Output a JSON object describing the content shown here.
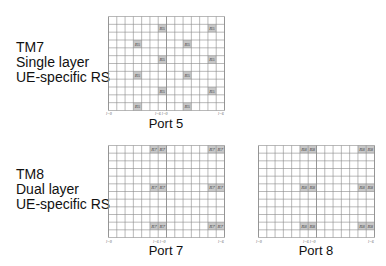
{
  "tm7": {
    "lines": [
      "TM7",
      "Single layer",
      "UE-specific RS"
    ],
    "port_label": "Port 5",
    "rs_label": "R5",
    "columns": 14,
    "rows": 12,
    "rs_cells": [
      [
        6,
        1
      ],
      [
        12,
        1
      ],
      [
        3,
        3
      ],
      [
        9,
        3
      ],
      [
        6,
        5
      ],
      [
        12,
        5
      ],
      [
        3,
        7
      ],
      [
        9,
        7
      ],
      [
        6,
        9
      ],
      [
        12,
        9
      ],
      [
        3,
        11
      ],
      [
        9,
        11
      ]
    ],
    "axis_labels": [
      "l=0",
      "l=6 l=0",
      "l=6"
    ]
  },
  "tm8": {
    "lines": [
      "TM8",
      "Dual layer",
      "UE-specific RS"
    ],
    "ports": [
      {
        "port_label": "Port 7",
        "rs_label": "R7",
        "columns": 14,
        "rows": 12,
        "rs_cells": [
          [
            5,
            0
          ],
          [
            6,
            0
          ],
          [
            12,
            0
          ],
          [
            13,
            0
          ],
          [
            5,
            5
          ],
          [
            6,
            5
          ],
          [
            12,
            5
          ],
          [
            13,
            5
          ],
          [
            5,
            10
          ],
          [
            6,
            10
          ],
          [
            12,
            10
          ],
          [
            13,
            10
          ]
        ],
        "axis_labels": [
          "l=0",
          "l=6 l=0",
          "l=6"
        ]
      },
      {
        "port_label": "Port 8",
        "rs_label": "R8",
        "columns": 14,
        "rows": 12,
        "rs_cells": [
          [
            5,
            0
          ],
          [
            6,
            0
          ],
          [
            12,
            0
          ],
          [
            13,
            0
          ],
          [
            5,
            5
          ],
          [
            6,
            5
          ],
          [
            12,
            5
          ],
          [
            13,
            5
          ],
          [
            5,
            10
          ],
          [
            6,
            10
          ],
          [
            12,
            10
          ],
          [
            13,
            10
          ]
        ],
        "axis_labels": [
          "l=0",
          "l=6 l=0",
          "l=6"
        ]
      }
    ]
  },
  "colors": {
    "grid_line": "#8a8a8a",
    "rs_fill": "#c8c8c8",
    "background": "#ffffff"
  }
}
